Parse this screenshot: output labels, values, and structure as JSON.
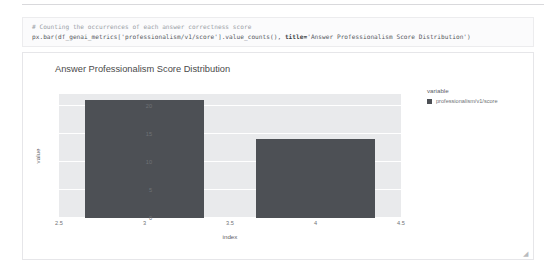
{
  "notebook": {
    "code_cell": {
      "comment": "# Counting the occurrences of each answer correctness score",
      "code_prefix": "px.bar(df_genai_metrics['professionalism/v1/score'].value_counts(), ",
      "code_keyword": "title=",
      "code_suffix": "'Answer Professionalism Score Distribution')"
    },
    "resize_handle_glyph": "◢"
  },
  "chart_data": {
    "type": "bar",
    "title": "Answer Professionalism Score Distribution",
    "xlabel": "index",
    "ylabel": "value",
    "x": [
      3,
      4
    ],
    "categories": [
      "3",
      "4"
    ],
    "values": [
      21,
      14
    ],
    "series": [
      {
        "name": "professionalism/v1/score",
        "values": [
          21,
          14
        ],
        "color": "#4d5055"
      }
    ],
    "xlim": [
      2.5,
      4.5
    ],
    "ylim": [
      0,
      22.1
    ],
    "xticks": [
      "2.5",
      "3",
      "3.5",
      "4",
      "4.5"
    ],
    "xtick_values": [
      2.5,
      3,
      3.5,
      4,
      4.5
    ],
    "yticks": [
      "0",
      "5",
      "10",
      "15",
      "20"
    ],
    "ytick_values": [
      0,
      5,
      10,
      15,
      20
    ],
    "grid": true,
    "legend": {
      "position": "right",
      "title": "variable",
      "entries": [
        {
          "label": "professionalism/v1/score",
          "color": "#4d5055"
        }
      ]
    },
    "plot_bgcolor": "#e9eaec",
    "paper_bgcolor": "#ffffff",
    "gridcolor": "#ffffff"
  }
}
